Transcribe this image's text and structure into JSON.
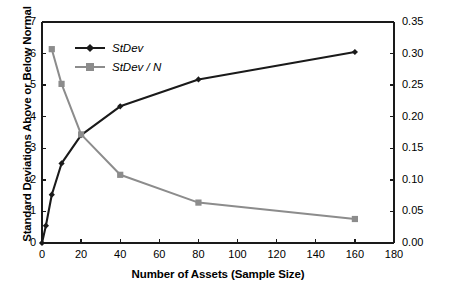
{
  "chart_data": {
    "type": "line",
    "title": "",
    "xlabel": "Number of Assets (Sample Size)",
    "ylabel": "Standard Deviations Above or Below Normal",
    "ylabel_right": "",
    "xlim": [
      0,
      180
    ],
    "ylim": [
      0,
      7
    ],
    "ylim_right": [
      0,
      0.35
    ],
    "xticks": [
      0,
      20,
      40,
      60,
      80,
      100,
      120,
      140,
      160,
      180
    ],
    "xtick_labels": [
      "0",
      "20",
      "40",
      "60",
      "80",
      "100",
      "120",
      "140",
      "160",
      "180"
    ],
    "yticks": [
      0,
      1,
      2,
      3,
      4,
      5,
      6,
      7
    ],
    "ytick_labels": [
      "0",
      "1",
      "2",
      "3",
      "4",
      "5",
      "6",
      "7"
    ],
    "yticks_right": [
      0.0,
      0.05,
      0.1,
      0.15,
      0.2,
      0.25,
      0.3,
      0.35
    ],
    "ytick_labels_right": [
      "0.00",
      "0.05",
      "0.10",
      "0.15",
      "0.20",
      "0.25",
      "0.30",
      "0.35"
    ],
    "grid": false,
    "legend_position": "upper-left-inside",
    "series": [
      {
        "name": "StDev",
        "axis": "left",
        "color": "#1a1a1a",
        "marker": "diamond",
        "x": [
          0,
          2,
          5,
          10,
          20,
          40,
          80,
          160
        ],
        "values": [
          0.0,
          0.55,
          1.53,
          2.52,
          3.42,
          4.33,
          5.18,
          6.05
        ]
      },
      {
        "name": "StDev / N",
        "axis": "right",
        "color": "#8c8c8c",
        "marker": "square",
        "x": [
          5,
          10,
          20,
          40,
          80,
          160
        ],
        "values": [
          0.307,
          0.252,
          0.172,
          0.108,
          0.064,
          0.038
        ]
      }
    ]
  },
  "legend": {
    "entries": [
      {
        "label": "StDev"
      },
      {
        "label": "StDev / N"
      }
    ]
  },
  "axes": {
    "x_title": "Number of Assets (Sample Size)",
    "y_title": "Standard Deviations Above or Below Normal"
  },
  "colors": {
    "series_primary": "#1a1a1a",
    "series_secondary": "#8c8c8c",
    "axis": "#1a1a1a",
    "background": "#ffffff"
  }
}
